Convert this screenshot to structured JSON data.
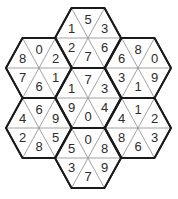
{
  "puzzle": {
    "title": "Hexagon number triangles",
    "colors": {
      "outline": "#1a1a1a",
      "inner_lines": "#8a8a8a",
      "numbers": "#2b2b2b",
      "background": "#ffffff"
    },
    "triangle_order": [
      "top",
      "upper-right",
      "lower-right",
      "bottom",
      "lower-left",
      "upper-left"
    ],
    "hexagons": [
      {
        "id": "top",
        "center": [
          88,
          38
        ],
        "values": [
          "5",
          "3",
          "6",
          "7",
          "2",
          "1"
        ]
      },
      {
        "id": "upper-left",
        "center": [
          39,
          68
        ],
        "values": [
          "0",
          "2",
          "1",
          "6",
          "7",
          "8"
        ]
      },
      {
        "id": "upper-right",
        "center": [
          138,
          68
        ],
        "values": [
          "8",
          "0",
          "9",
          "1",
          "3",
          "6"
        ]
      },
      {
        "id": "center",
        "center": [
          88,
          98
        ],
        "values": [
          "7",
          "3",
          "4",
          "0",
          "9",
          "1"
        ]
      },
      {
        "id": "lower-left",
        "center": [
          39,
          128
        ],
        "values": [
          "6",
          "9",
          "5",
          "8",
          "2",
          "4"
        ]
      },
      {
        "id": "lower-right",
        "center": [
          138,
          128
        ],
        "values": [
          "1",
          "2",
          "3",
          "6",
          "8",
          "4"
        ]
      },
      {
        "id": "bottom",
        "center": [
          88,
          158
        ],
        "values": [
          "0",
          "8",
          "9",
          "7",
          "3",
          "5"
        ]
      }
    ]
  }
}
